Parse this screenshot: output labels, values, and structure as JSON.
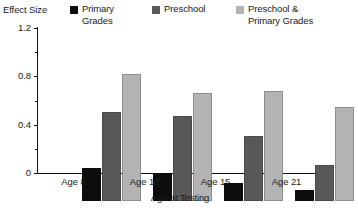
{
  "chart_data": {
    "type": "bar",
    "title": "",
    "xlabel": "Age at Testing",
    "ylabel": "Effect Size",
    "categories": [
      "Age 8",
      "Age 12",
      "Age 15",
      "Age 21"
    ],
    "ylim": [
      0,
      1.2
    ],
    "yticks": [
      0,
      0.4,
      0.8,
      1.2
    ],
    "ytick_labels": [
      "0",
      "0.4",
      "0.8",
      "1.2"
    ],
    "yticks_minor": [
      0.2,
      0.6,
      1.0
    ],
    "grid": false,
    "legend_position": "top",
    "series": [
      {
        "name": "Primary Grades",
        "color": "#0d0d0d",
        "values": [
          0.27,
          0.23,
          0.15,
          0.09
        ]
      },
      {
        "name": "Preschool",
        "color": "#585858",
        "values": [
          0.74,
          0.7,
          0.54,
          0.3
        ]
      },
      {
        "name": "Preschool & Primary Grades",
        "color": "#b3b3b3",
        "values": [
          1.05,
          0.89,
          0.91,
          0.78
        ]
      }
    ]
  },
  "legend": {
    "entries": [
      {
        "label": "Primary\nGrades",
        "swatch": "#0d0d0d"
      },
      {
        "label": "Preschool",
        "swatch": "#585858"
      },
      {
        "label": "Preschool &\nPrimary Grades",
        "swatch": "#b3b3b3"
      }
    ]
  },
  "axes": {
    "y_title": "Effect Size",
    "x_title": "Age at Testing",
    "y_labels": [
      "1.2",
      "0.8",
      "0.4",
      "0"
    ],
    "x_labels": [
      "Age 8",
      "Age 12",
      "Age 15",
      "Age 21"
    ]
  }
}
